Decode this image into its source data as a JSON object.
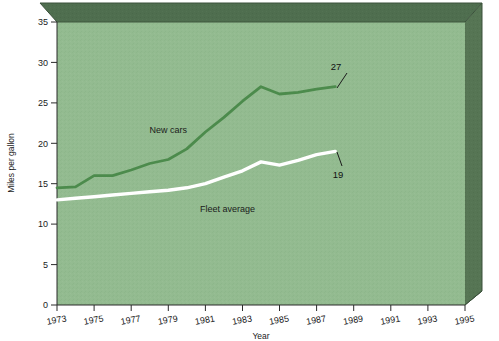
{
  "chart_data": {
    "type": "line",
    "title": "",
    "xlabel": "Year",
    "ylabel": "Miles per gallon",
    "xlim": [
      1973,
      1995
    ],
    "ylim": [
      0,
      35
    ],
    "ytick_values": [
      0,
      5,
      10,
      15,
      20,
      25,
      30,
      35
    ],
    "ytick_labels": [
      "0",
      "5",
      "10",
      "15",
      "20",
      "25",
      "30",
      "35"
    ],
    "xtick_values": [
      1973,
      1975,
      1977,
      1979,
      1981,
      1983,
      1985,
      1987,
      1989,
      1991,
      1993,
      1995
    ],
    "xtick_labels": [
      "1973",
      "1975",
      "1977",
      "1979",
      "1981",
      "1983",
      "1985",
      "1987",
      "1989",
      "1991",
      "1993",
      "1995"
    ],
    "grid": false,
    "legend_position": "inline-labels",
    "plot_background": "#8fb98c",
    "frame_shade": "#4b6b4b",
    "series": [
      {
        "name": "New cars",
        "color": "#4c8b4c",
        "label_x": 1979.0,
        "label_y": 21.3,
        "end_label": "27",
        "x": [
          1973,
          1974,
          1975,
          1976,
          1977,
          1978,
          1979,
          1980,
          1981,
          1982,
          1983,
          1984,
          1985,
          1986,
          1987,
          1988
        ],
        "values": [
          14.5,
          14.6,
          16.0,
          16.0,
          16.7,
          17.5,
          18.0,
          19.3,
          21.4,
          23.2,
          25.2,
          27.0,
          26.1,
          26.3,
          26.7,
          27.0
        ]
      },
      {
        "name": "Fleet average",
        "color": "#ffffff",
        "label_x": 1982.2,
        "label_y": 11.5,
        "end_label": "19",
        "x": [
          1973,
          1974,
          1975,
          1976,
          1977,
          1978,
          1979,
          1980,
          1981,
          1982,
          1983,
          1984,
          1985,
          1986,
          1987,
          1988
        ],
        "values": [
          13.0,
          13.2,
          13.4,
          13.6,
          13.8,
          14.0,
          14.2,
          14.5,
          15.0,
          15.8,
          16.6,
          17.7,
          17.3,
          17.9,
          18.6,
          19.0
        ]
      }
    ],
    "annotations": [
      {
        "name": "new-cars-end-value",
        "text": "27",
        "x": 1988.6,
        "y": 29.6
      },
      {
        "name": "fleet-average-end-value",
        "text": "19",
        "x": 1988.6,
        "y": 16.3
      }
    ]
  }
}
